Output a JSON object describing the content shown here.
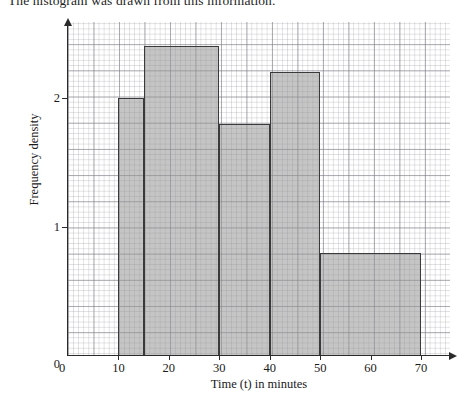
{
  "intro": {
    "text": "The histogram was drawn from this information."
  },
  "figure": {
    "name": "histogram-frequency-density-vs-time"
  },
  "axes": {
    "x": {
      "title": "Time (t) in minutes",
      "ticks": [
        {
          "value": 0,
          "label": "0"
        },
        {
          "value": 10,
          "label": "10"
        },
        {
          "value": 20,
          "label": "20"
        },
        {
          "value": 30,
          "label": "30"
        },
        {
          "value": 40,
          "label": "40"
        },
        {
          "value": 50,
          "label": "50"
        },
        {
          "value": 60,
          "label": "60"
        },
        {
          "value": 70,
          "label": "70"
        }
      ],
      "min": 0,
      "max": 75
    },
    "y": {
      "title": "Frequency density",
      "ticks": [
        {
          "value": 0,
          "label": "0"
        },
        {
          "value": 1,
          "label": "1"
        },
        {
          "value": 2,
          "label": "2"
        }
      ],
      "min": 0,
      "max": 2.55
    }
  },
  "style": {
    "bar_fill": "#969696",
    "bar_border": "#3a3a3a",
    "axis_color": "#2a2a2a",
    "grid_major": "#787880",
    "grid_minor": "#96969e"
  },
  "chart_data": {
    "type": "bar",
    "title": "",
    "xlabel": "Time (t) in minutes",
    "ylabel": "Frequency density",
    "xlim": [
      0,
      75
    ],
    "ylim": [
      0,
      2.55
    ],
    "grid": true,
    "legend": "none",
    "bar_style": "histogram-unequal-widths",
    "categories": [
      "10 < t ≤ 15",
      "15 < t ≤ 30",
      "30 < t ≤ 40",
      "40 < t ≤ 50",
      "50 < t ≤ 70"
    ],
    "bins": [
      {
        "start": 10,
        "end": 15,
        "frequency_density": 2.0
      },
      {
        "start": 15,
        "end": 30,
        "frequency_density": 2.4
      },
      {
        "start": 30,
        "end": 40,
        "frequency_density": 1.8
      },
      {
        "start": 40,
        "end": 50,
        "frequency_density": 2.2
      },
      {
        "start": 50,
        "end": 70,
        "frequency_density": 0.8
      }
    ],
    "values": [
      2.0,
      2.4,
      1.8,
      2.2,
      0.8
    ]
  }
}
